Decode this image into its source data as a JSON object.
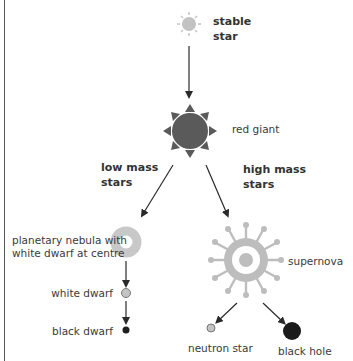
{
  "diagram": {
    "title": "",
    "colors": {
      "stable_star": "#c2c2c2",
      "red_giant": "#5a5a5a",
      "nebula": "#c8c8c8",
      "supernova": "#bdbdbd",
      "white_dwarf": "#c4c4c4",
      "black_dwarf": "#1e1e1e",
      "neutron_star": "#c4c4c4",
      "black_hole": "#1a1a1a",
      "arrow": "#2a2a2a"
    },
    "nodes": {
      "stable_star": {
        "label_line1": "stable",
        "label_line2": "star"
      },
      "red_giant": {
        "label": "red giant"
      },
      "planetary_nebula": {
        "label_line1": "planetary nebula with",
        "label_line2": "white dwarf at centre"
      },
      "white_dwarf": {
        "label": "white dwarf"
      },
      "black_dwarf": {
        "label": "black dwarf"
      },
      "supernova": {
        "label": "supernova"
      },
      "neutron_star": {
        "label": "neutron star"
      },
      "black_hole": {
        "label": "black hole"
      }
    },
    "branches": {
      "low_mass": {
        "label_line1": "low mass",
        "label_line2": "stars"
      },
      "high_mass": {
        "label_line1": "high mass",
        "label_line2": "stars"
      }
    }
  }
}
